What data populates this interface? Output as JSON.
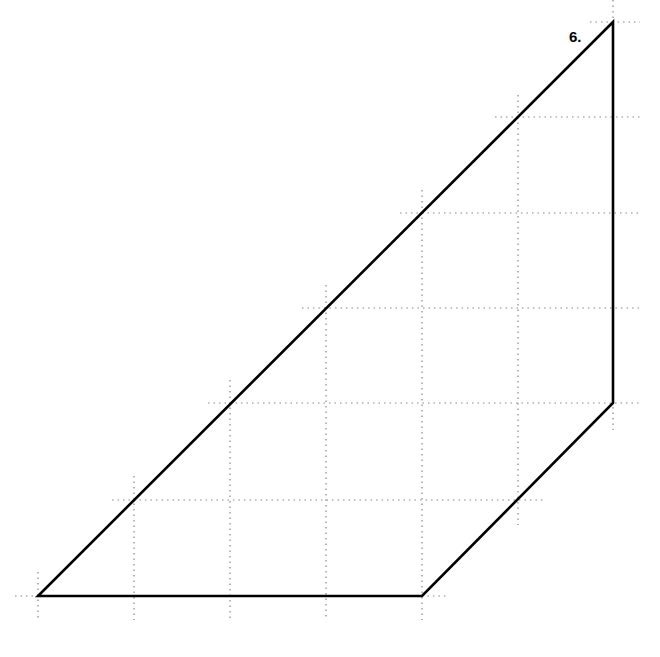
{
  "figure": {
    "label": "6.",
    "label_pos": [
      569,
      28
    ],
    "grid": {
      "spacing": 96,
      "color": "#888888",
      "dash": "1.5 4",
      "vertical": [
        {
          "x": 38,
          "y1": 572,
          "y2": 620
        },
        {
          "x": 134,
          "y1": 476,
          "y2": 620
        },
        {
          "x": 230,
          "y1": 380,
          "y2": 620
        },
        {
          "x": 326,
          "y1": 285,
          "y2": 620
        },
        {
          "x": 422,
          "y1": 190,
          "y2": 620
        },
        {
          "x": 518,
          "y1": 95,
          "y2": 525
        },
        {
          "x": 613,
          "y1": 0,
          "y2": 430
        }
      ],
      "horizontal": [
        {
          "y": 22,
          "x1": 590,
          "x2": 640
        },
        {
          "y": 117,
          "x1": 495,
          "x2": 640
        },
        {
          "y": 213,
          "x1": 400,
          "x2": 640
        },
        {
          "y": 308,
          "x1": 302,
          "x2": 640
        },
        {
          "y": 403,
          "x1": 208,
          "x2": 640
        },
        {
          "y": 500,
          "x1": 112,
          "x2": 545
        },
        {
          "y": 596,
          "x1": 15,
          "x2": 448
        }
      ]
    },
    "shape": {
      "type": "quadrilateral",
      "stroke": "#000000",
      "stroke_width": 2.6,
      "vertices": [
        [
          38,
          596
        ],
        [
          422,
          596
        ],
        [
          613,
          403
        ],
        [
          613,
          22
        ]
      ],
      "vertices_grid_units": [
        [
          0,
          0
        ],
        [
          4,
          0
        ],
        [
          6,
          2
        ],
        [
          6,
          6
        ]
      ]
    }
  }
}
